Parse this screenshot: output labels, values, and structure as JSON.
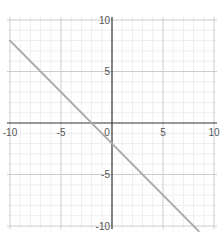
{
  "chart_data": {
    "type": "line",
    "title": "",
    "xlabel": "",
    "ylabel": "",
    "xlim": [
      -10.3,
      10.3
    ],
    "ylim": [
      -10.3,
      10.3
    ],
    "grid": true,
    "grid_minor_step": 1,
    "grid_major_step": 5,
    "x_ticks": [
      -10,
      -5,
      0,
      5,
      10
    ],
    "y_ticks": [
      10,
      5,
      -5,
      -10
    ],
    "x_tick_labels": [
      "-10",
      "-5",
      "0",
      "5",
      "10"
    ],
    "y_tick_labels": [
      "10",
      "5",
      "-5",
      "-10"
    ],
    "series": [
      {
        "name": "y = -x - 2",
        "equation": "y = -x - 2",
        "x": [
          -10,
          8.5
        ],
        "y": [
          8,
          -10.5
        ],
        "color": "#aaaaaa"
      }
    ],
    "intercepts": {
      "x_intercept": -2,
      "y_intercept": -2
    }
  },
  "colors": {
    "axis": "#333333",
    "grid_minor": "#eeeeee",
    "grid_major": "#cccccc",
    "line": "#aaaaaa",
    "label": "#555555"
  }
}
